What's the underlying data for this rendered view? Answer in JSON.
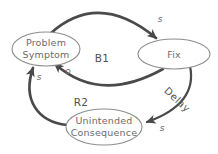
{
  "diagram": {
    "nodes": {
      "problem_symptom": {
        "line1": "Problem",
        "line2": "Symptom"
      },
      "fix": {
        "label": "Fix"
      },
      "unintended_consequence": {
        "line1": "Unintended",
        "line2": "Consequence"
      }
    },
    "loops": {
      "b1": "B1",
      "r2": "R2"
    },
    "links": {
      "problem_to_fix": {
        "polarity": "s"
      },
      "fix_to_problem": {
        "polarity": "o"
      },
      "fix_to_consequence": {
        "polarity": "s",
        "annotation": "Delay"
      },
      "consequence_to_problem": {
        "polarity": "s"
      }
    },
    "colors": {
      "background": "#ffffff",
      "arrow": "#4a4a4a",
      "ellipse_stroke": "#8d8d8d",
      "node_text": "#6b6b6b",
      "loop_text": "#4f4f4f",
      "polarity_text": "#6e6e6e"
    }
  }
}
